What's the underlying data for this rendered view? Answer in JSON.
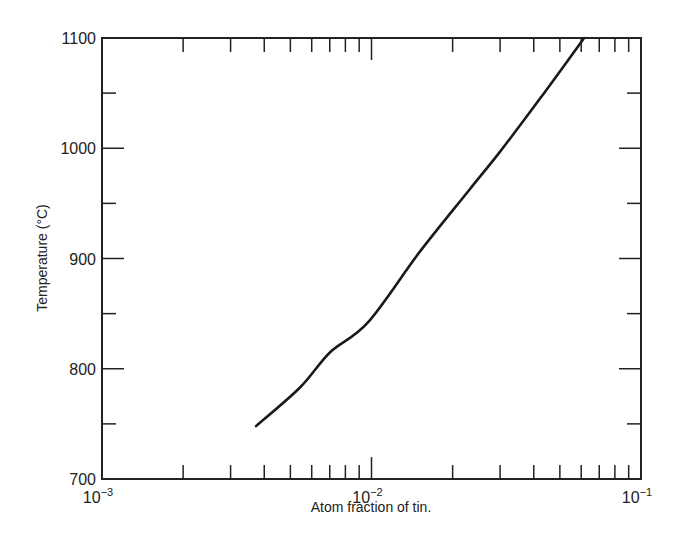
{
  "chart_data": {
    "type": "line",
    "title": "",
    "xlabel": "Atom fraction of tin.",
    "ylabel": "Temperature (°C)",
    "xscale": "log",
    "xlim": [
      0.001,
      0.1
    ],
    "ylim": [
      700,
      1100
    ],
    "x_ticks": [
      {
        "value": 0.001,
        "base": "10",
        "exp": "−3"
      },
      {
        "value": 0.01,
        "base": "10",
        "exp": "−2"
      },
      {
        "value": 0.1,
        "base": "10",
        "exp": "−1"
      }
    ],
    "y_ticks": [
      700,
      800,
      900,
      1000,
      1100
    ],
    "y_minor_step": 50,
    "grid": false,
    "legend": null,
    "series": [
      {
        "name": "solubility",
        "color": "#1a1a1a",
        "x": [
          0.00373,
          0.00543,
          0.00702,
          0.0097,
          0.0151,
          0.0232,
          0.03,
          0.0422,
          0.0615
        ],
        "y": [
          748,
          783,
          815,
          842,
          906,
          963,
          997,
          1045,
          1100
        ]
      }
    ]
  }
}
